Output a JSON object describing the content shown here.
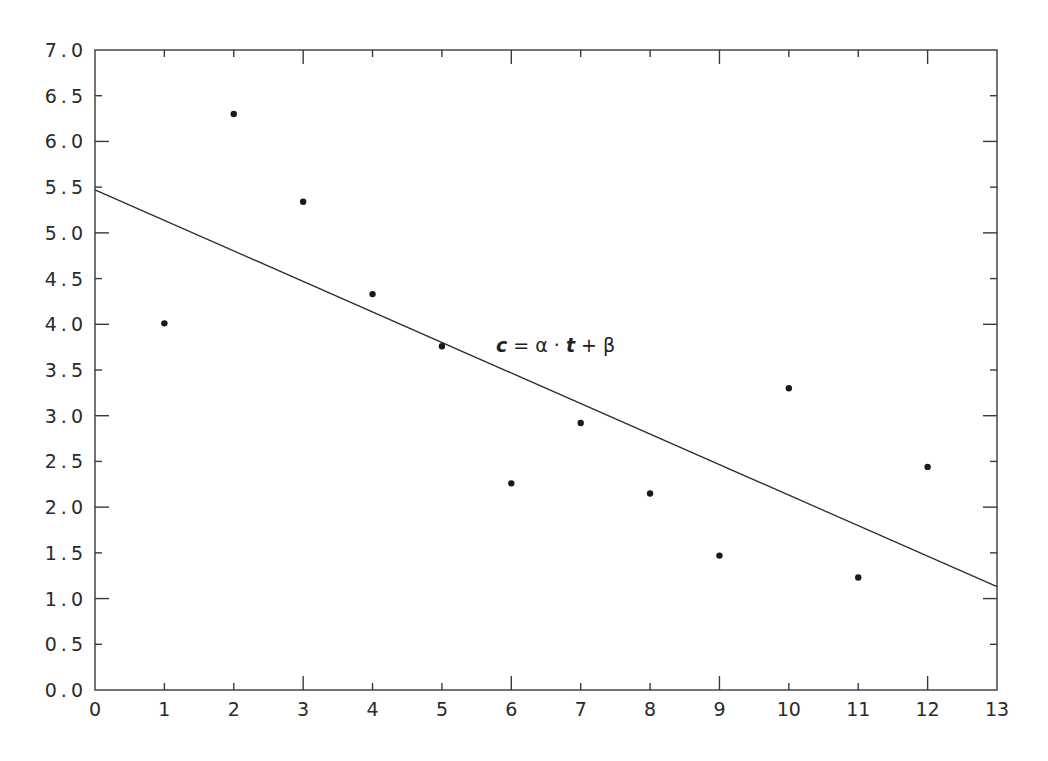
{
  "chart_data": {
    "type": "scatter",
    "title": "",
    "xlabel": "",
    "ylabel": "",
    "xlim": [
      0,
      13
    ],
    "ylim": [
      0,
      7.0
    ],
    "grid": false,
    "legend": null,
    "x_ticks": [
      "0",
      "1",
      "2",
      "3",
      "4",
      "5",
      "6",
      "7",
      "8",
      "9",
      "10",
      "11",
      "12",
      "13"
    ],
    "y_ticks": [
      "0.0",
      "0.5",
      "1.0",
      "1.5",
      "2.0",
      "2.5",
      "3.0",
      "3.5",
      "4.0",
      "4.5",
      "5.0",
      "5.5",
      "6.0",
      "6.5",
      "7.0"
    ],
    "series": [
      {
        "name": "observations",
        "type": "scatter",
        "x": [
          1,
          2,
          3,
          4,
          5,
          6,
          7,
          8,
          9,
          10,
          11,
          12
        ],
        "values": [
          4.01,
          6.3,
          5.34,
          4.33,
          3.76,
          2.26,
          2.92,
          2.15,
          1.47,
          3.3,
          1.23,
          2.44
        ]
      },
      {
        "name": "linear fit",
        "type": "line",
        "x": [
          0,
          13
        ],
        "values": [
          5.47,
          1.13
        ]
      }
    ],
    "annotations": [
      {
        "text": "c = α · t + β",
        "x": 5.8,
        "y": 3.78
      }
    ]
  },
  "annotation": {
    "c": "c",
    "eq": " = ",
    "alpha": "α",
    "dot": " · ",
    "t": "t",
    "plus": " + ",
    "beta": "β"
  }
}
